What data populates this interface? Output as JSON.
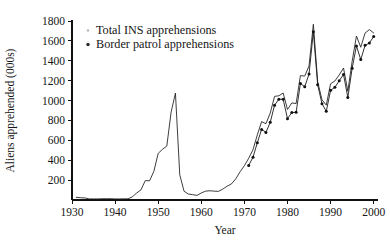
{
  "chart_data": {
    "type": "line",
    "title": "",
    "xlabel": "Year",
    "ylabel": "Aliens apprehended (000s)",
    "xlim": [
      1930,
      2001
    ],
    "ylim": [
      0,
      1800
    ],
    "grid": false,
    "legend_position": "top-left",
    "xticks": [
      1930,
      1940,
      1950,
      1960,
      1970,
      1980,
      1990,
      2000
    ],
    "xtick_labels": [
      "1930",
      "1940",
      "1950",
      "1960",
      "1970",
      "1980",
      "1990",
      "2000"
    ],
    "yticks": [
      200,
      400,
      600,
      800,
      1000,
      1200,
      1400,
      1600,
      1800
    ],
    "ytick_labels": [
      "200",
      "400",
      "600",
      "800",
      "1000",
      "1200",
      "1400",
      "1600",
      "1800"
    ],
    "series": [
      {
        "name": "Total INS apprehensions",
        "marker": "none",
        "x": [
          1931,
          1932,
          1933,
          1934,
          1935,
          1936,
          1937,
          1938,
          1939,
          1940,
          1941,
          1942,
          1943,
          1944,
          1945,
          1946,
          1947,
          1948,
          1949,
          1950,
          1951,
          1952,
          1953,
          1954,
          1955,
          1956,
          1957,
          1958,
          1959,
          1960,
          1961,
          1962,
          1963,
          1964,
          1965,
          1966,
          1967,
          1968,
          1969,
          1970,
          1971,
          1972,
          1973,
          1974,
          1975,
          1976,
          1977,
          1978,
          1979,
          1980,
          1981,
          1982,
          1983,
          1984,
          1985,
          1986,
          1987,
          1988,
          1989,
          1990,
          1991,
          1992,
          1993,
          1994,
          1995,
          1996,
          1997,
          1998,
          1999,
          2000
        ],
        "values": [
          27,
          23,
          21,
          11,
          11,
          11,
          13,
          13,
          13,
          11,
          11,
          12,
          12,
          32,
          70,
          102,
          195,
          193,
          289,
          469,
          510,
          543,
          885,
          1075,
          254,
          88,
          60,
          54,
          46,
          71,
          89,
          93,
          89,
          87,
          110,
          139,
          162,
          212,
          284,
          345,
          420,
          506,
          655,
          788,
          767,
          875,
          1042,
          1048,
          1076,
          910,
          976,
          970,
          1251,
          1246,
          1348,
          1767,
          1190,
          1008,
          954,
          1169,
          1197,
          1258,
          1327,
          1094,
          1394,
          1649,
          1536,
          1679,
          1714,
          1680
        ]
      },
      {
        "name": "Border patrol apprehensions",
        "marker": "dot",
        "x": [
          1971,
          1972,
          1973,
          1974,
          1975,
          1976,
          1977,
          1978,
          1979,
          1980,
          1981,
          1982,
          1983,
          1984,
          1985,
          1986,
          1987,
          1988,
          1989,
          1990,
          1991,
          1992,
          1993,
          1994,
          1995,
          1996,
          1997,
          1998,
          1999,
          2000
        ],
        "values": [
          348,
          430,
          576,
          710,
          680,
          781,
          954,
          1014,
          1012,
          818,
          879,
          882,
          1172,
          1139,
          1266,
          1693,
          1159,
          969,
          892,
          1103,
          1133,
          1199,
          1263,
          1031,
          1324,
          1549,
          1412,
          1555,
          1579,
          1643
        ]
      }
    ],
    "legend_entries": [
      {
        "label": "Total INS apprehensions",
        "marker": "faint-dot"
      },
      {
        "label": "Border patrol apprehensions",
        "marker": "solid-dot"
      }
    ]
  },
  "geometry": {
    "plot_left": 72,
    "plot_right": 378,
    "plot_bottom": 200,
    "plot_top": 21,
    "x_min": 1930,
    "x_max": 2001,
    "y_min": 0,
    "y_max": 1800
  },
  "legend_layout": {
    "x_text": 96,
    "y_first": 34,
    "line_height": 14,
    "dot_x": 88
  }
}
